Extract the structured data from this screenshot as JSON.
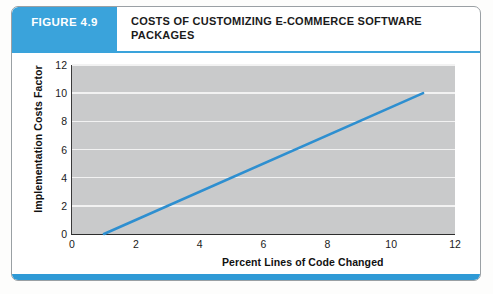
{
  "figure": {
    "badge_label": "FIGURE 4.9",
    "title": "COSTS OF CUSTOMIZING E-COMMERCE SOFTWARE PACKAGES",
    "badge_color": "#3aa3db",
    "rule_color": "#2f9ad6"
  },
  "chart_data": {
    "type": "line",
    "title": "COSTS OF CUSTOMIZING E-COMMERCE SOFTWARE PACKAGES",
    "xlabel": "Percent Lines of Code Changed",
    "ylabel": "Implementation Costs Factor",
    "xlim": [
      0,
      12
    ],
    "ylim": [
      0,
      12
    ],
    "xticks": [
      0,
      2,
      4,
      6,
      8,
      10,
      12
    ],
    "yticks": [
      0,
      2,
      4,
      6,
      8,
      10,
      12
    ],
    "grid": "horizontal",
    "legend": "none",
    "plot_background": "#c9cacb",
    "series": [
      {
        "name": "Implementation costs factor",
        "color": "#2e8fd0",
        "x": [
          1,
          11
        ],
        "y": [
          0,
          10
        ]
      }
    ]
  },
  "page_footer_text": ""
}
